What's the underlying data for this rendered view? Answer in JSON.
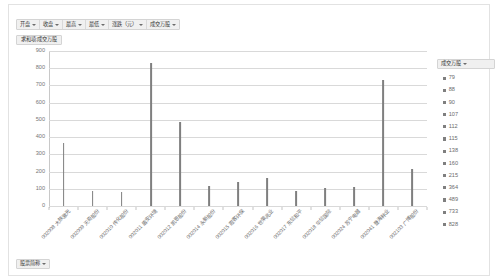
{
  "filter_bar": {
    "buttons": [
      {
        "label": "开盘",
        "name": "filter-open-price"
      },
      {
        "label": "收盘",
        "name": "filter-close-price"
      },
      {
        "label": "最高",
        "name": "filter-high-price"
      },
      {
        "label": "最低",
        "name": "filter-low-price"
      },
      {
        "label": "涨跌（元）",
        "name": "filter-change-yuan"
      },
      {
        "label": "成交万股",
        "name": "filter-volume"
      }
    ]
  },
  "value_field": {
    "label": "求和项:成交万股"
  },
  "axis_field": {
    "label": "股票简称"
  },
  "legend": {
    "title": "成交万股",
    "items": [
      "79",
      "88",
      "90",
      "107",
      "112",
      "115",
      "138",
      "160",
      "215",
      "364",
      "489",
      "733",
      "828"
    ]
  },
  "chart_data": {
    "type": "bar",
    "title": "求和项:成交万股",
    "xlabel": "股票简称",
    "ylabel": "成交万股",
    "ylim": [
      0,
      900
    ],
    "ytick_step": 100,
    "yticks": [
      "900",
      "800",
      "700",
      "600",
      "500",
      "400",
      "300",
      "200",
      "100",
      "0"
    ],
    "grid": true,
    "legend_position": "right",
    "bar_color": "#7f7f7f",
    "categories": [
      "002008 大族激光",
      "002009 天奇股份",
      "002010 传化股份",
      "002011 盾安环境",
      "002012 凯恩股份",
      "002014 永新股份",
      "002015 霞客环保",
      "002016 世荣兆业",
      "002017 东信和平",
      "002018 华信国际",
      "002024 苏宁电器",
      "002041 登海种业",
      "002103 广博股份"
    ],
    "values": [
      364,
      88,
      79,
      828,
      489,
      115,
      138,
      160,
      90,
      107,
      112,
      733,
      215
    ]
  }
}
